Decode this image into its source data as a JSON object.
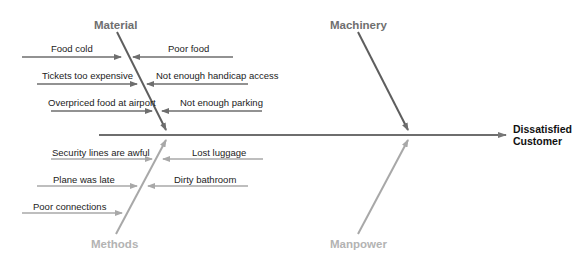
{
  "diagram": {
    "type": "fishbone",
    "effect": {
      "line1": "Dissatisfied",
      "line2": "Customer"
    },
    "categories": {
      "material": {
        "label": "Material",
        "causes_left": [
          "Food cold",
          "Tickets too expensive",
          "Overpriced food at airport"
        ],
        "causes_right": [
          "Poor food",
          "Not enough handicap access",
          "Not enough parking"
        ]
      },
      "machinery": {
        "label": "Machinery",
        "causes": []
      },
      "methods": {
        "label": "Methods",
        "causes_left": [
          "Security lines are awful",
          "Plane was late",
          "Poor connections"
        ],
        "causes_right": [
          "Lost luggage",
          "Dirty bathroom"
        ]
      },
      "manpower": {
        "label": "Manpower",
        "causes": []
      }
    },
    "colors": {
      "spine": "#6e6e6e",
      "top_bones": "#6e6e6e",
      "bottom_bones": "#a8a8a8",
      "top_category_text": "#6f6f6f",
      "bottom_category_text": "#b3b3b3",
      "cause_text": "#222222",
      "effect_text": "#111111"
    }
  }
}
